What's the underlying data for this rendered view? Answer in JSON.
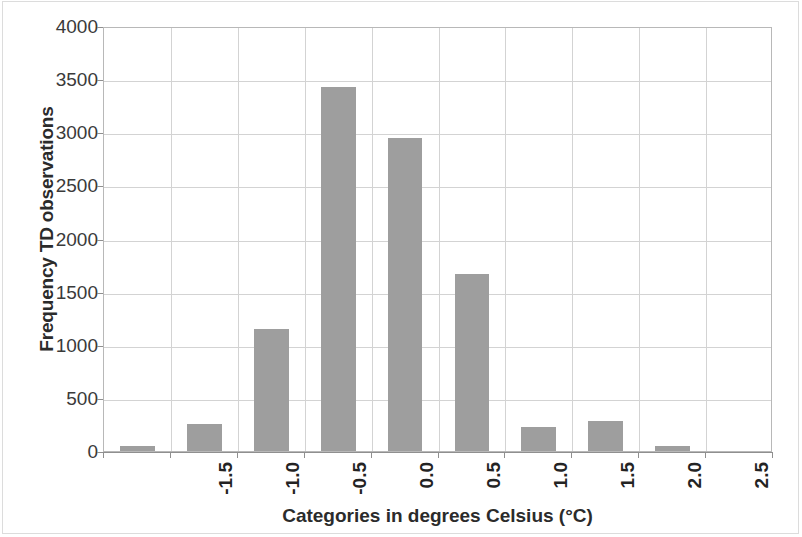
{
  "chart_data": {
    "type": "bar",
    "title": "",
    "xlabel": "Categories in degrees Celsius (°C)",
    "ylabel": "Frequency TD observations",
    "categories": [
      "-1.5",
      "-1.0",
      "-0.5",
      "0.0",
      "0.5",
      "1.0",
      "1.5",
      "2.0",
      "2.5",
      "3.0"
    ],
    "values": [
      45,
      250,
      1145,
      3425,
      2950,
      1665,
      225,
      285,
      45,
      0
    ],
    "series": [
      {
        "name": "Frequency TD observations",
        "values": [
          45,
          250,
          1145,
          3425,
          2950,
          1665,
          225,
          285,
          45,
          0
        ]
      }
    ],
    "ylim": [
      0,
      4000
    ],
    "y_ticks": [
      0,
      500,
      1000,
      1500,
      2000,
      2500,
      3000,
      3500,
      4000
    ],
    "y_ticklabels": [
      "0",
      "500",
      "1000",
      "1500",
      "2000",
      "2500",
      "3000",
      "3500",
      "4000"
    ],
    "grid": "both",
    "legend": "none",
    "bar_color": "#9e9e9e",
    "plot_border_color": "#b8b8b8",
    "gridline_color": "#d3d3d3"
  }
}
